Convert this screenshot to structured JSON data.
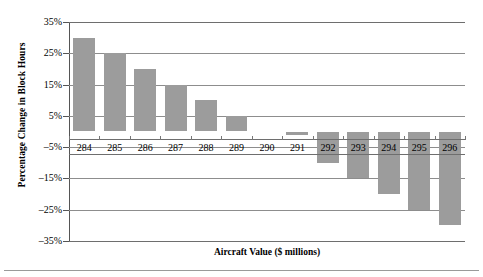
{
  "chart_data": {
    "type": "bar",
    "title": "",
    "xlabel": "Aircraft Value ($ millions)",
    "ylabel": "Percentage Change in Block Hours",
    "categories": [
      "284",
      "285",
      "286",
      "287",
      "288",
      "289",
      "290",
      "291",
      "292",
      "293",
      "294",
      "295",
      "296"
    ],
    "values": [
      30,
      25,
      20,
      15,
      10,
      5,
      0,
      -1,
      -10,
      -15,
      -20,
      -25,
      -30
    ],
    "ylim": [
      -35,
      35
    ],
    "ytick_labels": [
      "35%",
      "25%",
      "15%",
      "5%",
      "-5%",
      "-15%",
      "-25%",
      "-35%"
    ],
    "ytick_values": [
      35,
      25,
      15,
      5,
      -5,
      -15,
      -25,
      -35
    ],
    "grid": true,
    "legend": null,
    "bar_color": "#9c9c9c",
    "axis_color": "#6e6e6e",
    "grid_color": "#8d8d8d"
  },
  "axis": {
    "y_title": "Percentage Change in Block Hours",
    "x_title": "Aircraft Value ($ millions)"
  }
}
